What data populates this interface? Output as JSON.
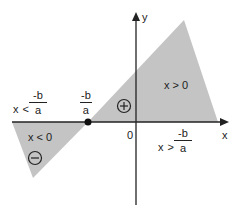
{
  "colors": {
    "shade": "#c4c4c4",
    "axis": "#222222",
    "text": "#222222",
    "point": "#111111"
  },
  "axes": {
    "x_label": "x",
    "y_label": "y",
    "origin_label": "0"
  },
  "root": {
    "numerator": "-b",
    "denominator": "a"
  },
  "left_interval": {
    "variable": "x",
    "relation": "<",
    "numerator": "-b",
    "denominator": "a"
  },
  "right_interval": {
    "variable": "x",
    "relation": ">",
    "numerator": "-b",
    "denominator": "a"
  },
  "regions": {
    "positive": {
      "label": "x > 0",
      "sign": "+"
    },
    "negative": {
      "label": "x < 0",
      "sign": "−"
    }
  }
}
